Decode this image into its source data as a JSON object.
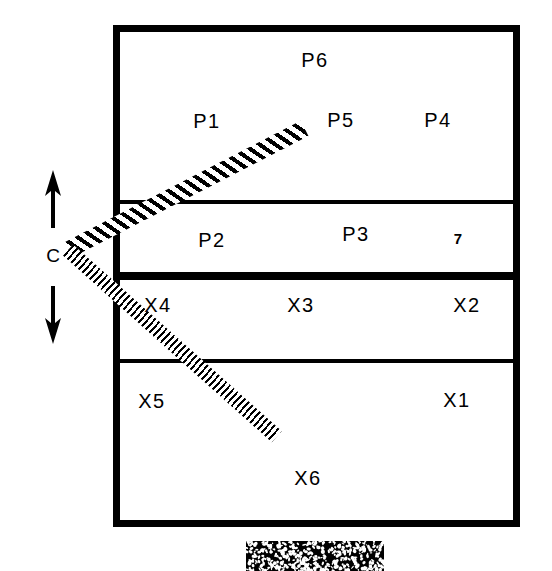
{
  "diagram": {
    "colors": {
      "line": "#000000",
      "background": "#ffffff"
    },
    "dimension_marker": {
      "label": "C",
      "up_arrow_icon": "arrow-up-icon",
      "down_arrow_icon": "arrow-down-icon"
    },
    "tick_mark": {
      "label": "7"
    },
    "regions": [
      {
        "key": "p6",
        "label": "P6",
        "x": 315,
        "y": 60
      },
      {
        "key": "p1",
        "label": "P1",
        "x": 207,
        "y": 121
      },
      {
        "key": "p5",
        "label": "P5",
        "x": 341,
        "y": 120
      },
      {
        "key": "p4",
        "label": "P4",
        "x": 438,
        "y": 120
      },
      {
        "key": "p2",
        "label": "P2",
        "x": 212,
        "y": 240
      },
      {
        "key": "p3",
        "label": "P3",
        "x": 356,
        "y": 234
      },
      {
        "key": "x4",
        "label": "X4",
        "x": 158,
        "y": 305
      },
      {
        "key": "x3",
        "label": "X3",
        "x": 301,
        "y": 305
      },
      {
        "key": "x2",
        "label": "X2",
        "x": 467,
        "y": 305
      },
      {
        "key": "x5",
        "label": "X5",
        "x": 152,
        "y": 401
      },
      {
        "key": "x1",
        "label": "X1",
        "x": 457,
        "y": 400
      },
      {
        "key": "x6",
        "label": "X6",
        "x": 308,
        "y": 478
      }
    ],
    "dividers": [
      {
        "key": "p-upper",
        "weight": "thin",
        "y": 200
      },
      {
        "key": "p-x-split",
        "weight": "thick",
        "y": 272
      },
      {
        "key": "x-lower",
        "weight": "thin",
        "y": 359
      }
    ],
    "bands": [
      {
        "key": "upper-band",
        "style": "coarse-hatch",
        "direction": "up-right"
      },
      {
        "key": "lower-band",
        "style": "fine-hatch",
        "direction": "down-right"
      }
    ],
    "speckle_block": {
      "key": "speckle-block",
      "label": "mottled texture block"
    }
  }
}
